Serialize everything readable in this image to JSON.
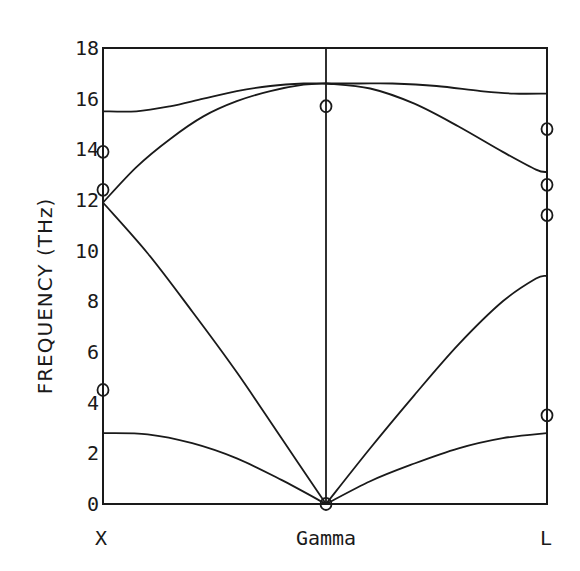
{
  "chart_data": {
    "type": "line",
    "title": "",
    "xlabel": "",
    "ylabel": "FREQUENCY (THz)",
    "ylim": [
      0,
      18
    ],
    "yticks": [
      0,
      2,
      4,
      6,
      8,
      10,
      12,
      14,
      16,
      18
    ],
    "ytick_labels": [
      "0",
      "2",
      "4",
      "6",
      "8",
      "10",
      "12",
      "14",
      "16",
      "18"
    ],
    "x_points": [
      {
        "label": "X",
        "pos": 0
      },
      {
        "label": "Gamma",
        "pos": 1
      },
      {
        "label": "L",
        "pos": 2
      }
    ],
    "grid": false,
    "legend": null,
    "series": [
      {
        "name": "X-Gamma upper optic branch",
        "x": [
          0,
          0.15,
          0.3,
          0.45,
          0.6,
          0.75,
          0.9,
          1.0
        ],
        "y": [
          15.5,
          15.5,
          15.7,
          16.0,
          16.3,
          16.5,
          16.6,
          16.6
        ]
      },
      {
        "name": "X-Gamma lower optic branch",
        "x": [
          0,
          0.15,
          0.3,
          0.45,
          0.6,
          0.75,
          0.9,
          1.0
        ],
        "y": [
          11.9,
          13.3,
          14.4,
          15.3,
          15.9,
          16.3,
          16.55,
          16.6
        ]
      },
      {
        "name": "X-Gamma longitudinal acoustic",
        "x": [
          0,
          0.2,
          0.4,
          0.6,
          0.8,
          1.0
        ],
        "y": [
          11.9,
          9.9,
          7.6,
          5.2,
          2.6,
          0
        ]
      },
      {
        "name": "X-Gamma transverse acoustic",
        "x": [
          0,
          0.2,
          0.4,
          0.6,
          0.8,
          1.0
        ],
        "y": [
          2.8,
          2.75,
          2.4,
          1.8,
          0.95,
          0
        ]
      },
      {
        "name": "Gamma-L upper optic branch",
        "x": [
          1.0,
          1.15,
          1.3,
          1.5,
          1.7,
          1.85,
          2.0
        ],
        "y": [
          16.6,
          16.6,
          16.6,
          16.5,
          16.3,
          16.2,
          16.2
        ]
      },
      {
        "name": "Gamma-L lower optic branch",
        "x": [
          1.0,
          1.2,
          1.4,
          1.6,
          1.8,
          1.95,
          2.0
        ],
        "y": [
          16.6,
          16.4,
          15.8,
          14.9,
          13.9,
          13.2,
          13.1
        ]
      },
      {
        "name": "Gamma-L longitudinal acoustic",
        "x": [
          1.0,
          1.2,
          1.4,
          1.6,
          1.8,
          1.95,
          2.0
        ],
        "y": [
          0,
          2.2,
          4.3,
          6.3,
          8.0,
          8.9,
          9.0
        ]
      },
      {
        "name": "Gamma-L transverse acoustic",
        "x": [
          1.0,
          1.2,
          1.4,
          1.6,
          1.8,
          2.0
        ],
        "y": [
          0,
          0.9,
          1.6,
          2.2,
          2.6,
          2.8
        ]
      }
    ],
    "experimental_points": [
      {
        "x": 0,
        "y": 13.9
      },
      {
        "x": 0,
        "y": 12.4
      },
      {
        "x": 0,
        "y": 4.5
      },
      {
        "x": 1,
        "y": 15.7
      },
      {
        "x": 1,
        "y": 0
      },
      {
        "x": 2,
        "y": 14.8
      },
      {
        "x": 2,
        "y": 12.6
      },
      {
        "x": 2,
        "y": 11.4
      },
      {
        "x": 2,
        "y": 3.5
      }
    ]
  },
  "axes": {
    "ylabel": "FREQUENCY (THz)",
    "qpoints": [
      "X",
      "Gamma",
      "L"
    ],
    "yticks": [
      "0",
      "2",
      "4",
      "6",
      "8",
      "10",
      "12",
      "14",
      "16",
      "18"
    ]
  }
}
